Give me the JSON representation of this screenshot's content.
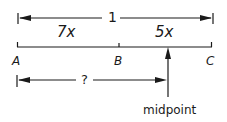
{
  "diagram": {
    "total_length_label": "1",
    "segment_ab_label": "7x",
    "segment_bc_label": "5x",
    "points": {
      "a": "A",
      "b": "B",
      "c": "C"
    },
    "unknown_distance_label": "?",
    "midpoint_label": "midpoint",
    "stroke_color": "#1a1a1a"
  }
}
